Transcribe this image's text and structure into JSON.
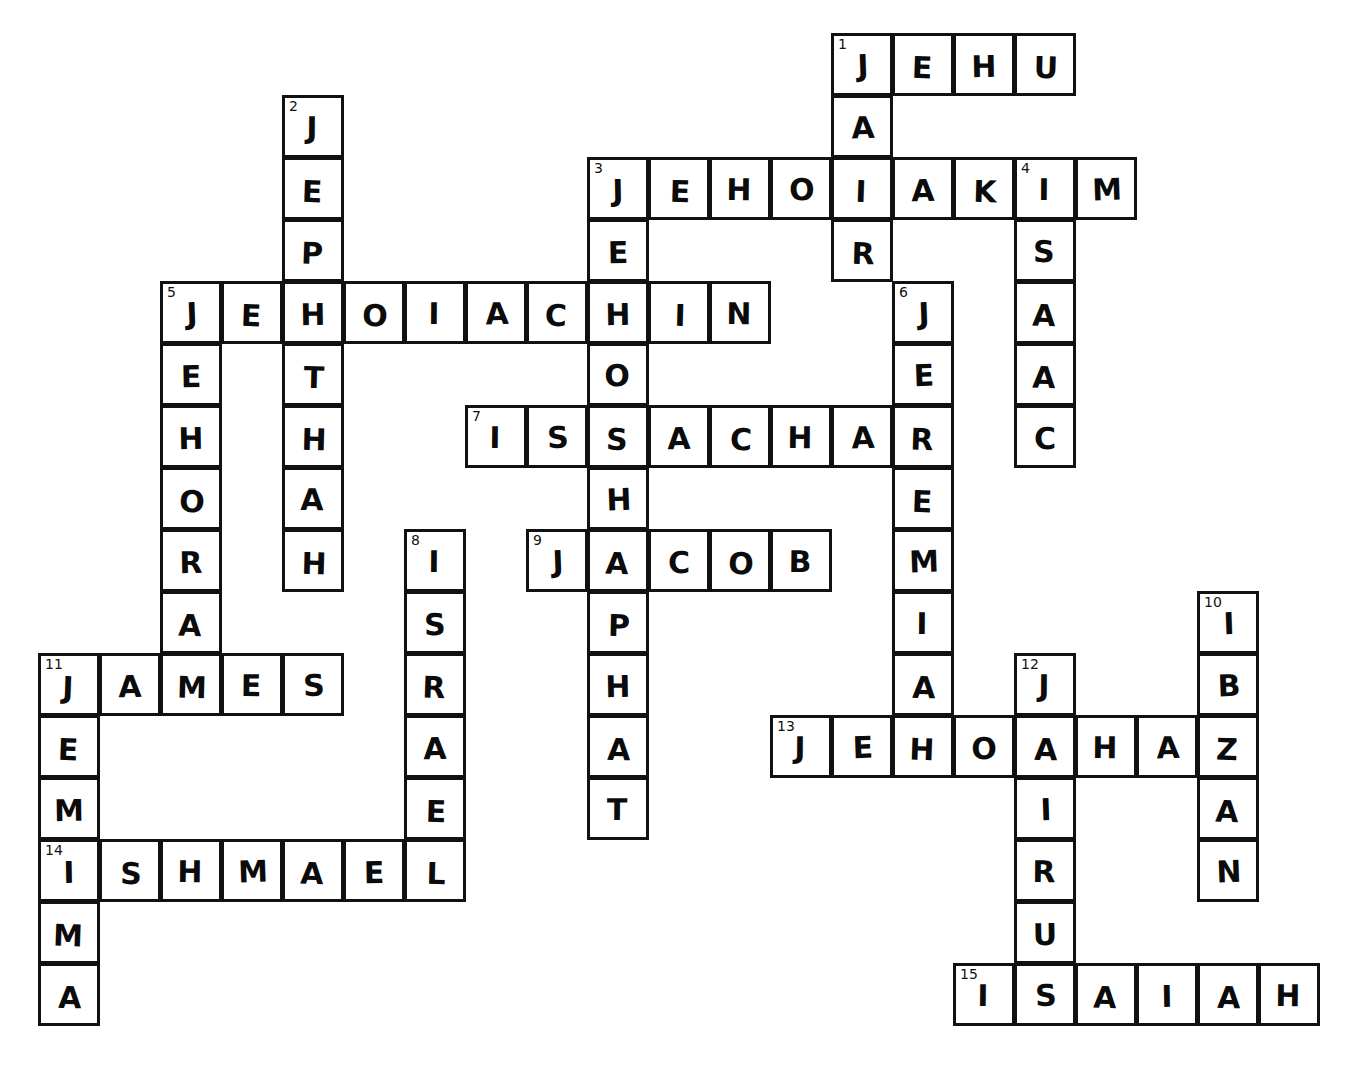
{
  "puzzle": {
    "title": "Bible Names Crossword",
    "type": "crossword-grid",
    "cell_size": 61,
    "origin_x": 38,
    "origin_y": 33,
    "ink_color": "#111111",
    "cell_color": "#ffffff",
    "entries": [
      {
        "number": "1",
        "direction": "across",
        "answer": "JEHU",
        "row": 0,
        "col": 13
      },
      {
        "number": "1",
        "direction": "down",
        "answer": "JAIR",
        "row": 0,
        "col": 13
      },
      {
        "number": "2",
        "direction": "down",
        "answer": "JEPHTHAH",
        "row": 1,
        "col": 4
      },
      {
        "number": "3",
        "direction": "across",
        "answer": "JEHOIAKIM",
        "row": 2,
        "col": 9
      },
      {
        "number": "3",
        "direction": "down",
        "answer": "JEHOSHAPHAT",
        "row": 2,
        "col": 9
      },
      {
        "number": "4",
        "direction": "down",
        "answer": "ISAAC",
        "row": 2,
        "col": 16
      },
      {
        "number": "5",
        "direction": "across",
        "answer": "JEHOIACHIN",
        "row": 4,
        "col": 2
      },
      {
        "number": "5",
        "direction": "down",
        "answer": "JEHORAM",
        "row": 4,
        "col": 2
      },
      {
        "number": "6",
        "direction": "down",
        "answer": "JEREMIAH",
        "row": 4,
        "col": 14
      },
      {
        "number": "7",
        "direction": "across",
        "answer": "ISSACHAR",
        "row": 6,
        "col": 7
      },
      {
        "number": "8",
        "direction": "down",
        "answer": "ISRAEL",
        "row": 8,
        "col": 6
      },
      {
        "number": "9",
        "direction": "across",
        "answer": "JACOB",
        "row": 8,
        "col": 8
      },
      {
        "number": "10",
        "direction": "down",
        "answer": "IBZAN",
        "row": 9,
        "col": 19
      },
      {
        "number": "11",
        "direction": "across",
        "answer": "JAMES",
        "row": 10,
        "col": 0
      },
      {
        "number": "11",
        "direction": "down",
        "answer": "JEMIMA",
        "row": 10,
        "col": 0
      },
      {
        "number": "12",
        "direction": "down",
        "answer": "JAIRUS",
        "row": 10,
        "col": 16
      },
      {
        "number": "13",
        "direction": "across",
        "answer": "JEHOAHAZ",
        "row": 11,
        "col": 12
      },
      {
        "number": "14",
        "direction": "across",
        "answer": "ISHMAEL",
        "row": 13,
        "col": 0
      },
      {
        "number": "15",
        "direction": "across",
        "answer": "ISAIAH",
        "row": 15,
        "col": 15
      }
    ],
    "cells": [
      {
        "r": 0,
        "c": 13,
        "l": "J",
        "n": "1"
      },
      {
        "r": 0,
        "c": 14,
        "l": "E"
      },
      {
        "r": 0,
        "c": 15,
        "l": "H"
      },
      {
        "r": 0,
        "c": 16,
        "l": "U"
      },
      {
        "r": 1,
        "c": 4,
        "l": "J",
        "n": "2"
      },
      {
        "r": 1,
        "c": 13,
        "l": "A"
      },
      {
        "r": 2,
        "c": 4,
        "l": "E"
      },
      {
        "r": 2,
        "c": 9,
        "l": "J",
        "n": "3"
      },
      {
        "r": 2,
        "c": 10,
        "l": "E"
      },
      {
        "r": 2,
        "c": 11,
        "l": "H"
      },
      {
        "r": 2,
        "c": 12,
        "l": "O"
      },
      {
        "r": 2,
        "c": 13,
        "l": "I"
      },
      {
        "r": 2,
        "c": 14,
        "l": "A"
      },
      {
        "r": 2,
        "c": 15,
        "l": "K"
      },
      {
        "r": 2,
        "c": 16,
        "l": "I",
        "n": "4"
      },
      {
        "r": 2,
        "c": 17,
        "l": "M"
      },
      {
        "r": 3,
        "c": 4,
        "l": "P"
      },
      {
        "r": 3,
        "c": 9,
        "l": "E"
      },
      {
        "r": 3,
        "c": 13,
        "l": "R"
      },
      {
        "r": 3,
        "c": 16,
        "l": "S"
      },
      {
        "r": 4,
        "c": 2,
        "l": "J",
        "n": "5"
      },
      {
        "r": 4,
        "c": 3,
        "l": "E"
      },
      {
        "r": 4,
        "c": 4,
        "l": "H"
      },
      {
        "r": 4,
        "c": 5,
        "l": "O"
      },
      {
        "r": 4,
        "c": 6,
        "l": "I"
      },
      {
        "r": 4,
        "c": 7,
        "l": "A"
      },
      {
        "r": 4,
        "c": 8,
        "l": "C"
      },
      {
        "r": 4,
        "c": 9,
        "l": "H"
      },
      {
        "r": 4,
        "c": 10,
        "l": "I"
      },
      {
        "r": 4,
        "c": 11,
        "l": "N"
      },
      {
        "r": 4,
        "c": 14,
        "l": "J",
        "n": "6"
      },
      {
        "r": 4,
        "c": 16,
        "l": "A"
      },
      {
        "r": 5,
        "c": 2,
        "l": "E"
      },
      {
        "r": 5,
        "c": 4,
        "l": "T"
      },
      {
        "r": 5,
        "c": 9,
        "l": "O"
      },
      {
        "r": 5,
        "c": 14,
        "l": "E"
      },
      {
        "r": 5,
        "c": 16,
        "l": "A"
      },
      {
        "r": 6,
        "c": 2,
        "l": "H"
      },
      {
        "r": 6,
        "c": 4,
        "l": "H"
      },
      {
        "r": 6,
        "c": 7,
        "l": "I",
        "n": "7"
      },
      {
        "r": 6,
        "c": 8,
        "l": "S"
      },
      {
        "r": 6,
        "c": 9,
        "l": "S"
      },
      {
        "r": 6,
        "c": 10,
        "l": "A"
      },
      {
        "r": 6,
        "c": 11,
        "l": "C"
      },
      {
        "r": 6,
        "c": 12,
        "l": "H"
      },
      {
        "r": 6,
        "c": 13,
        "l": "A"
      },
      {
        "r": 6,
        "c": 14,
        "l": "R"
      },
      {
        "r": 6,
        "c": 16,
        "l": "C"
      },
      {
        "r": 7,
        "c": 2,
        "l": "O"
      },
      {
        "r": 7,
        "c": 4,
        "l": "A"
      },
      {
        "r": 7,
        "c": 9,
        "l": "H"
      },
      {
        "r": 7,
        "c": 14,
        "l": "E"
      },
      {
        "r": 8,
        "c": 2,
        "l": "R"
      },
      {
        "r": 8,
        "c": 4,
        "l": "H"
      },
      {
        "r": 8,
        "c": 6,
        "l": "I",
        "n": "8"
      },
      {
        "r": 8,
        "c": 8,
        "l": "J",
        "n": "9"
      },
      {
        "r": 8,
        "c": 9,
        "l": "A"
      },
      {
        "r": 8,
        "c": 10,
        "l": "C"
      },
      {
        "r": 8,
        "c": 11,
        "l": "O"
      },
      {
        "r": 8,
        "c": 12,
        "l": "B"
      },
      {
        "r": 8,
        "c": 14,
        "l": "M"
      },
      {
        "r": 9,
        "c": 2,
        "l": "A"
      },
      {
        "r": 9,
        "c": 6,
        "l": "S"
      },
      {
        "r": 9,
        "c": 9,
        "l": "P"
      },
      {
        "r": 9,
        "c": 14,
        "l": "I"
      },
      {
        "r": 9,
        "c": 19,
        "l": "I",
        "n": "10"
      },
      {
        "r": 10,
        "c": 0,
        "l": "J",
        "n": "11"
      },
      {
        "r": 10,
        "c": 1,
        "l": "A"
      },
      {
        "r": 10,
        "c": 2,
        "l": "M"
      },
      {
        "r": 10,
        "c": 3,
        "l": "E"
      },
      {
        "r": 10,
        "c": 4,
        "l": "S"
      },
      {
        "r": 10,
        "c": 6,
        "l": "R"
      },
      {
        "r": 10,
        "c": 9,
        "l": "H"
      },
      {
        "r": 10,
        "c": 14,
        "l": "A"
      },
      {
        "r": 10,
        "c": 16,
        "l": "J",
        "n": "12"
      },
      {
        "r": 10,
        "c": 19,
        "l": "B"
      },
      {
        "r": 11,
        "c": 0,
        "l": "E"
      },
      {
        "r": 11,
        "c": 6,
        "l": "A"
      },
      {
        "r": 11,
        "c": 9,
        "l": "A"
      },
      {
        "r": 11,
        "c": 12,
        "l": "J",
        "n": "13"
      },
      {
        "r": 11,
        "c": 13,
        "l": "E"
      },
      {
        "r": 11,
        "c": 14,
        "l": "H"
      },
      {
        "r": 11,
        "c": 15,
        "l": "O"
      },
      {
        "r": 11,
        "c": 16,
        "l": "A"
      },
      {
        "r": 11,
        "c": 17,
        "l": "H"
      },
      {
        "r": 11,
        "c": 18,
        "l": "A"
      },
      {
        "r": 11,
        "c": 19,
        "l": "Z"
      },
      {
        "r": 12,
        "c": 0,
        "l": "M"
      },
      {
        "r": 12,
        "c": 6,
        "l": "E"
      },
      {
        "r": 12,
        "c": 9,
        "l": "T"
      },
      {
        "r": 12,
        "c": 16,
        "l": "I"
      },
      {
        "r": 12,
        "c": 19,
        "l": "A"
      },
      {
        "r": 13,
        "c": 0,
        "l": "I",
        "n": "14"
      },
      {
        "r": 13,
        "c": 1,
        "l": "S"
      },
      {
        "r": 13,
        "c": 2,
        "l": "H"
      },
      {
        "r": 13,
        "c": 3,
        "l": "M"
      },
      {
        "r": 13,
        "c": 4,
        "l": "A"
      },
      {
        "r": 13,
        "c": 5,
        "l": "E"
      },
      {
        "r": 13,
        "c": 6,
        "l": "L"
      },
      {
        "r": 13,
        "c": 16,
        "l": "R"
      },
      {
        "r": 13,
        "c": 19,
        "l": "N"
      },
      {
        "r": 14,
        "c": 0,
        "l": "M"
      },
      {
        "r": 14,
        "c": 16,
        "l": "U"
      },
      {
        "r": 15,
        "c": 0,
        "l": "A"
      },
      {
        "r": 15,
        "c": 15,
        "l": "I",
        "n": "15"
      },
      {
        "r": 15,
        "c": 16,
        "l": "S"
      },
      {
        "r": 15,
        "c": 17,
        "l": "A"
      },
      {
        "r": 15,
        "c": 18,
        "l": "I"
      },
      {
        "r": 15,
        "c": 19,
        "l": "A"
      },
      {
        "r": 15,
        "c": 20,
        "l": "H"
      }
    ]
  }
}
